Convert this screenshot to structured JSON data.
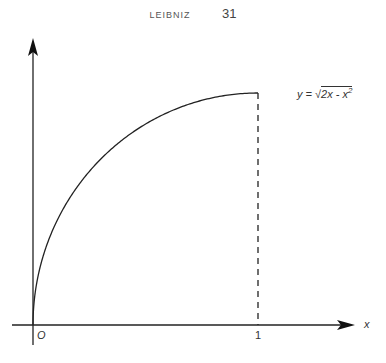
{
  "header": {
    "running_title": "LEIBNIZ",
    "page_number": "31"
  },
  "labels": {
    "origin": "O",
    "x_axis": "x",
    "tick_one": "1",
    "equation_lhs": "y =",
    "equation_radicand": "2x - x",
    "equation_exponent": "2"
  },
  "chart_data": {
    "type": "line",
    "title": "",
    "xlabel": "x",
    "ylabel": "",
    "function": "y = sqrt(2x - x^2)",
    "x": [
      0,
      0.05,
      0.1,
      0.2,
      0.3,
      0.4,
      0.5,
      0.6,
      0.7,
      0.8,
      0.9,
      1.0
    ],
    "y": [
      0,
      0.312,
      0.436,
      0.6,
      0.714,
      0.8,
      0.866,
      0.917,
      0.954,
      0.98,
      0.995,
      1.0
    ],
    "annotations": [
      "O",
      "1",
      "dashed vertical at x=1"
    ],
    "xlim": [
      0,
      1.35
    ],
    "ylim": [
      0,
      1.25
    ],
    "grid": false
  }
}
